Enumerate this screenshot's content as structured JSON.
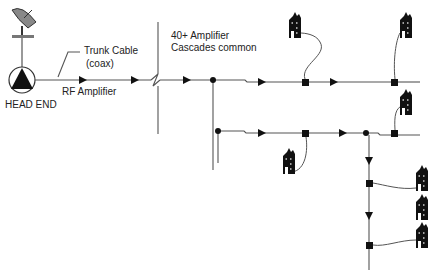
{
  "diagram": {
    "type": "cable-tv-tree-and-branch-network",
    "labels": {
      "trunk_cable_line1": "Trunk Cable",
      "trunk_cable_line2": "(coax)",
      "rf_amplifier": "RF Amplifier",
      "head_end": "HEAD END",
      "cascade_line1": "40+ Amplifier",
      "cascade_line2": "Cascades common"
    },
    "icons": {
      "satellite_dish": "satellite-dish-icon",
      "head_end": "head-end-triangle-in-circle",
      "amplifier": "triangle-arrow",
      "tap": "black-square",
      "splitter": "black-dot",
      "home": "house-icon"
    },
    "colors": {
      "line": "#555555",
      "symbol": "#111111",
      "text": "#222222"
    }
  }
}
